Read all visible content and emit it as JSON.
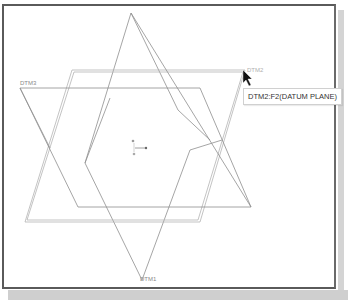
{
  "viewport": {
    "labels": {
      "dtm1": "DTM1",
      "dtm2": "DTM2",
      "dtm3": "DTM3"
    },
    "tooltip": "DTM2:F2(DATUM PLANE)",
    "cursor": "arrow-pointer",
    "csys": "coordinate-system-icon"
  },
  "colors": {
    "frame": "#5a5a5a",
    "datum_lines": "#9a9a9a",
    "highlight": "#c8c8c8",
    "tooltip_border": "#d0d0d0",
    "background": "#ffffff"
  }
}
